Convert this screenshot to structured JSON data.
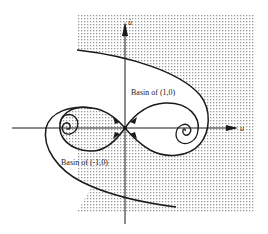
{
  "figure": {
    "type": "phase-portrait",
    "axes": {
      "horizontal_label": "u",
      "vertical_label": "u̇"
    },
    "labels": {
      "basin_right": "Basin of (1,0)",
      "basin_left": "Basin of (-1,0)"
    },
    "equilibria": [
      {
        "name": "saddle",
        "point": "(0,0)"
      },
      {
        "name": "stable-focus-right",
        "point": "(1,0)"
      },
      {
        "name": "stable-focus-left",
        "point": "(-1,0)"
      }
    ],
    "colors": {
      "ink": "#1a1a1a",
      "stipple": "#9a9a9a",
      "background": "#ffffff"
    }
  }
}
